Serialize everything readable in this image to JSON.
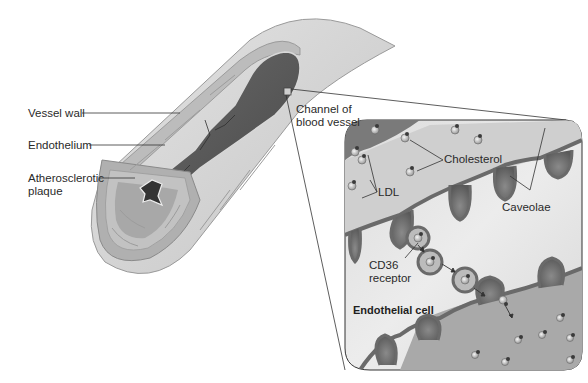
{
  "diagram": {
    "title": "",
    "vessel_labels": {
      "vessel_wall": "Vessel wall",
      "endothelium": "Endothelium",
      "plaque": "Atherosclerotic\nplaque"
    },
    "detail_labels": {
      "channel": "Channel of\nblood vessel",
      "cholesterol": "Cholesterol",
      "ldl": "LDL",
      "caveolae": "Caveolae",
      "cd36": "CD36\nreceptor",
      "endothelial_cell": "Endothelial cell"
    },
    "colors": {
      "vessel_outer": "#d6d6d6",
      "vessel_wall": "#bdbdbd",
      "lumen": "#5e5e5e",
      "panel_bg": "#e6e6e6",
      "blood_channel": "#7a7a7a",
      "membrane": "#6a6a6a",
      "plaque_core": "#333333"
    }
  }
}
